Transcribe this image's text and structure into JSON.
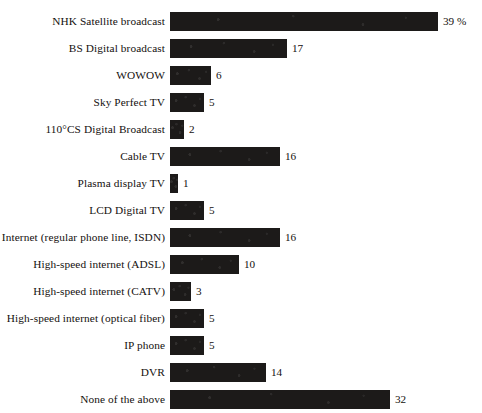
{
  "chart_data": {
    "type": "bar",
    "orientation": "horizontal",
    "title": "",
    "subtitle": "",
    "xlabel": "",
    "ylabel": "",
    "grid": false,
    "legend": false,
    "axis_lines": false,
    "xlim": [
      0,
      39
    ],
    "unit_suffix": "%",
    "categories": [
      "NHK Satellite broadcast",
      "BS Digital broadcast",
      "WOWOW",
      "Sky Perfect TV",
      "110°CS Digital Broadcast",
      "Cable TV",
      "Plasma display TV",
      "LCD Digital TV",
      "Internet (regular phone line, ISDN)",
      "High-speed internet (ADSL)",
      "High-speed internet (CATV)",
      "High-speed internet (optical fiber)",
      "IP phone",
      "DVR",
      "None of the above"
    ],
    "values": [
      39,
      17,
      6,
      5,
      2,
      16,
      1,
      5,
      16,
      10,
      3,
      5,
      5,
      14,
      32
    ],
    "value_labels": [
      "39 %",
      "17",
      "6",
      "5",
      "2",
      "16",
      "1",
      "5",
      "16",
      "10",
      "3",
      "5",
      "5",
      "14",
      "32"
    ],
    "bar_color": "#1c1a19",
    "background_color": "#ffffff",
    "text_color": "#14100e"
  }
}
